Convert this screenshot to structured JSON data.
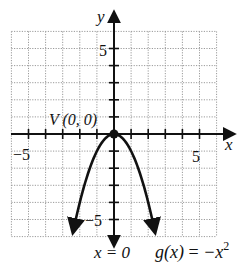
{
  "figure": {
    "type": "function-graph",
    "function_label": "g(x) = −x²",
    "function_name": "g(x)",
    "function_rhs": "−x",
    "function_exp": "2",
    "vertex_label": "V (0, 0)",
    "axis_of_symmetry_label": "x = 0",
    "x_axis_label": "x",
    "y_axis_label": "y",
    "tick_labels": {
      "x_pos": "5",
      "x_neg": "−5",
      "y_pos": "5",
      "y_neg": "−5"
    },
    "grid": {
      "xmin": -6,
      "xmax": 6,
      "ymin": -6,
      "ymax": 6,
      "step": 1,
      "style": "dotted"
    },
    "curve": {
      "equation": "y = -x^2",
      "vertex": [
        0,
        0
      ],
      "opens": "down",
      "x_range": [
        -2.4,
        2.4
      ]
    },
    "colors": {
      "curve": "#111111",
      "grid": "#9a9a9a",
      "axes": "#111111"
    }
  }
}
